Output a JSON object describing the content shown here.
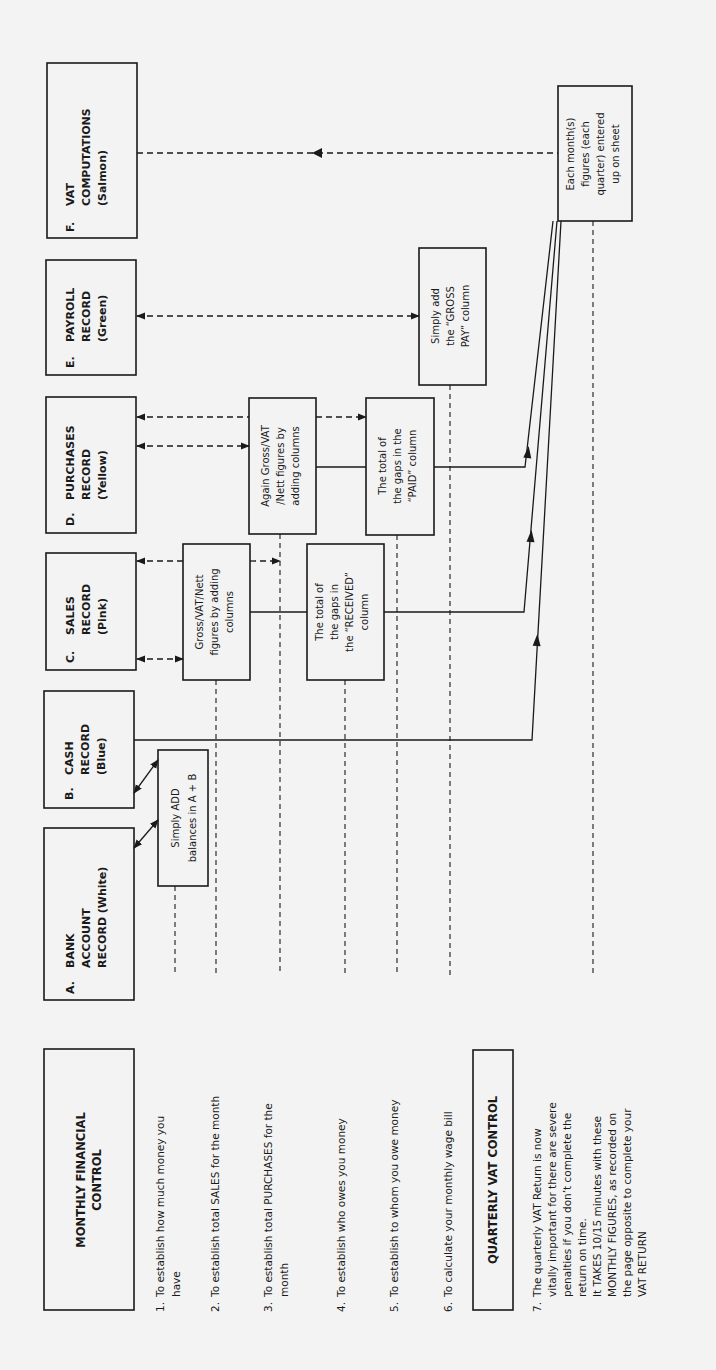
{
  "page": {
    "orientation": "rotated 90deg counter-clockwise",
    "background": "#f3f3f3",
    "ink": "#1a1a1a"
  },
  "records": [
    {
      "letter": "A.",
      "lines": [
        "BANK",
        "ACCOUNT",
        "RECORD (White)"
      ]
    },
    {
      "letter": "B.",
      "lines": [
        "CASH",
        "RECORD",
        "(Blue)"
      ]
    },
    {
      "letter": "C.",
      "lines": [
        "SALES",
        "RECORD",
        "(Pink)"
      ]
    },
    {
      "letter": "D.",
      "lines": [
        "PURCHASES",
        "RECORD",
        "(Yellow)"
      ]
    },
    {
      "letter": "E.",
      "lines": [
        "PAYROLL",
        "RECORD",
        "(Green)"
      ]
    },
    {
      "letter": "F.",
      "lines": [
        "VAT",
        "COMPUTATIONS",
        "(Salmon)"
      ]
    }
  ],
  "process_boxes": {
    "add_ab": [
      "Simply ADD",
      "balances in A + B"
    ],
    "sales_gross": [
      "Gross/VAT/Nett",
      "figures by adding",
      "columns"
    ],
    "purchases_gross": [
      "Again Gross/VAT",
      "/Nett figures by",
      "adding columns"
    ],
    "received_gaps": [
      "The total of",
      "the gaps in",
      "the “RECEIVED”",
      "column"
    ],
    "paid_gaps": [
      "The total of",
      "the gaps in the",
      "“PAID” column"
    ],
    "gross_pay": [
      "Simply add",
      "the “GROSS",
      "PAY” column"
    ],
    "each_month": [
      "Each month(s)",
      "figures (each",
      "quarter) entered",
      "up on sheet"
    ]
  },
  "monthly_control": {
    "title": [
      "MONTHLY FINANCIAL",
      "CONTROL"
    ],
    "items": [
      {
        "num": "1.",
        "lines": [
          "To establish how much money you",
          "have"
        ]
      },
      {
        "num": "2.",
        "lines": [
          "To establish total SALES for the month"
        ]
      },
      {
        "num": "3.",
        "lines": [
          "To establish total PURCHASES for the",
          "month"
        ]
      },
      {
        "num": "4.",
        "lines": [
          "To establish who owes you money"
        ]
      },
      {
        "num": "5.",
        "lines": [
          "To establish to whom you owe money"
        ]
      },
      {
        "num": "6.",
        "lines": [
          "To calculate your monthly wage bill"
        ]
      }
    ]
  },
  "quarterly_control": {
    "title": "QUARTERLY VAT CONTROL",
    "item": {
      "num": "7.",
      "lines": [
        "The quarterly VAT Return is now",
        "vitally important for there are severe",
        "penalties if you don’t complete the",
        "return on time.",
        "It TAKES 10/15 minutes with these",
        "MONTHLY FIGURES, as recorded on",
        "the page opposite to complete your",
        "VAT RETURN"
      ]
    }
  }
}
